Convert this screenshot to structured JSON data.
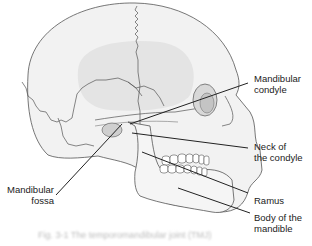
{
  "figure": {
    "labels": {
      "mandibular_condyle": [
        "Mandibular",
        "condyle"
      ],
      "neck_of_condyle": [
        "Neck of",
        "the condyle"
      ],
      "ramus": [
        "Ramus"
      ],
      "body_of_mandible": [
        "Body of the",
        "mandible"
      ],
      "mandibular_fossa": [
        "Mandibular",
        "fossa"
      ]
    },
    "caption": "Fig. 3-1  The temporomandibular joint (TMJ)",
    "colors": {
      "bone_fill": "#f2f2f2",
      "bone_shade": "#dcdcdc",
      "outline": "#555555",
      "leader": "#222222",
      "text": "#222222"
    }
  }
}
